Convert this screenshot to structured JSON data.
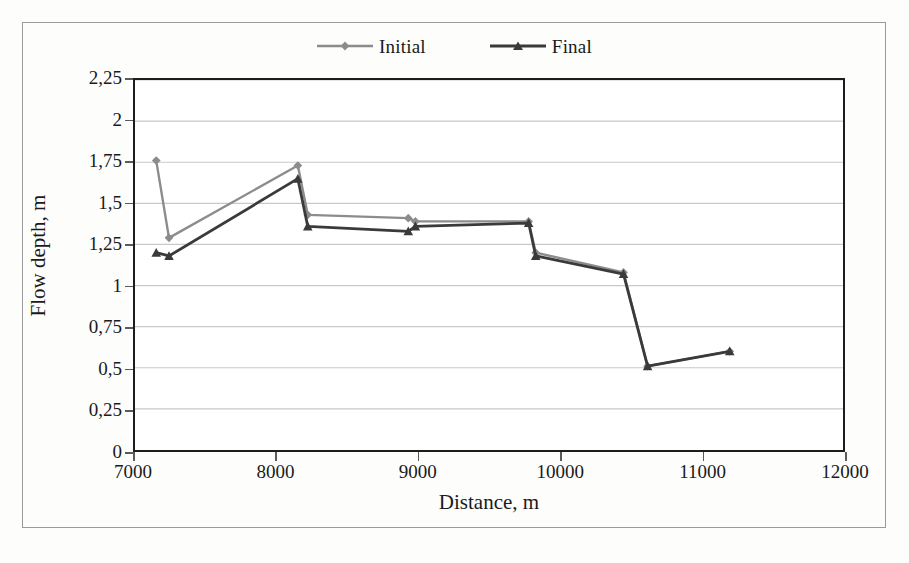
{
  "chart_data": {
    "type": "line",
    "title": "",
    "xlabel": "Distance, m",
    "ylabel": "Flow depth, m",
    "xlim": [
      7000,
      12000
    ],
    "ylim": [
      0,
      2.25
    ],
    "xticks": [
      "7000",
      "8000",
      "9000",
      "10000",
      "11000",
      "12000"
    ],
    "xtick_values": [
      7000,
      8000,
      9000,
      10000,
      11000,
      12000
    ],
    "yticks": [
      "0",
      "0,25",
      "0,5",
      "0,75",
      "1",
      "1,25",
      "1,5",
      "1,75",
      "2",
      "2,25"
    ],
    "ytick_values": [
      0,
      0.25,
      0.5,
      0.75,
      1,
      1.25,
      1.5,
      1.75,
      2,
      2.25
    ],
    "decimal_separator": ",",
    "grid": "horizontal",
    "legend_position": "top-center",
    "series": [
      {
        "name": "Initial",
        "color": "#8c8c8c",
        "marker": "diamond",
        "x": [
          7150,
          7240,
          8150,
          8220,
          8930,
          8980,
          9780,
          9830,
          10450,
          10620,
          11200
        ],
        "values": [
          1.76,
          1.29,
          1.73,
          1.43,
          1.41,
          1.39,
          1.39,
          1.2,
          1.08,
          0.51,
          0.6
        ]
      },
      {
        "name": "Final",
        "color": "#3a3a3a",
        "marker": "triangle",
        "x": [
          7150,
          7240,
          8150,
          8220,
          8930,
          8980,
          9780,
          9830,
          10450,
          10620,
          11200
        ],
        "values": [
          1.2,
          1.18,
          1.65,
          1.36,
          1.33,
          1.36,
          1.38,
          1.18,
          1.07,
          0.51,
          0.6
        ]
      }
    ]
  },
  "legend": {
    "entries": [
      {
        "label": "Initial"
      },
      {
        "label": "Final"
      }
    ]
  },
  "axes": {
    "x_title": "Distance, m",
    "y_title": "Flow depth, m"
  },
  "colors": {
    "initial": "#8c8c8c",
    "final": "#3a3a3a",
    "grid": "#c9c9c9",
    "frame": "#1d1d1d",
    "background": "#ffffff"
  }
}
